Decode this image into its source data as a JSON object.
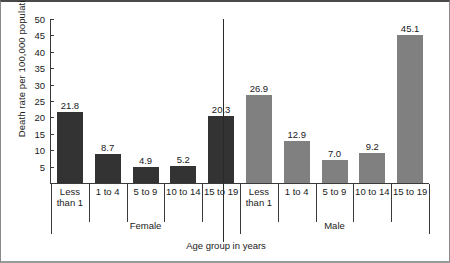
{
  "chart_data": {
    "type": "bar",
    "title": "",
    "xlabel": "Age group in years",
    "ylabel": "Death rate per 100,000 population",
    "ylim": [
      0,
      50
    ],
    "ytick_values": [
      0,
      5,
      10,
      15,
      20,
      25,
      30,
      35,
      40,
      45,
      50
    ],
    "ytick_labels": [
      "",
      "5",
      "10",
      "15",
      "20",
      "25",
      "30",
      "35",
      "40",
      "45",
      "50"
    ],
    "grid": false,
    "legend": "none",
    "categories": [
      "Less than 1",
      "1 to 4",
      "5 to 9",
      "10 to 14",
      "15 to 19"
    ],
    "groups": [
      {
        "name": "Female",
        "color": "#333333",
        "bars": [
          {
            "category": "Less\nthan 1",
            "label_line1": "Less",
            "label_line2": "than 1",
            "value": 21.8,
            "value_label": "21.8"
          },
          {
            "category": "1 to 4",
            "label_line1": "1 to 4",
            "label_line2": "",
            "value": 8.7,
            "value_label": "8.7"
          },
          {
            "category": "5 to 9",
            "label_line1": "5 to 9",
            "label_line2": "",
            "value": 4.9,
            "value_label": "4.9"
          },
          {
            "category": "10 to 14",
            "label_line1": "10 to 14",
            "label_line2": "",
            "value": 5.2,
            "value_label": "5.2"
          },
          {
            "category": "15 to 19",
            "label_line1": "15 to 19",
            "label_line2": "",
            "value": 20.3,
            "value_label": "20.3"
          }
        ]
      },
      {
        "name": "Male",
        "color": "#808080",
        "bars": [
          {
            "category": "Less\nthan 1",
            "label_line1": "Less",
            "label_line2": "than 1",
            "value": 26.9,
            "value_label": "26.9"
          },
          {
            "category": "1 to 4",
            "label_line1": "1 to 4",
            "label_line2": "",
            "value": 12.9,
            "value_label": "12.9"
          },
          {
            "category": "5 to 9",
            "label_line1": "5 to 9",
            "label_line2": "",
            "value": 7.0,
            "value_label": "7.0"
          },
          {
            "category": "10 to 14",
            "label_line1": "10 to 14",
            "label_line2": "",
            "value": 9.2,
            "value_label": "9.2"
          },
          {
            "category": "15 to 19",
            "label_line1": "15 to 19",
            "label_line2": "",
            "value": 45.1,
            "value_label": "45.1"
          }
        ]
      }
    ],
    "series": [
      {
        "name": "Female",
        "values": [
          21.8,
          8.7,
          4.9,
          5.2,
          20.3
        ]
      },
      {
        "name": "Male",
        "values": [
          26.9,
          12.9,
          7.0,
          9.2,
          45.1
        ]
      }
    ]
  },
  "colors": {
    "female_bar": "#333333",
    "male_bar": "#808080",
    "axis": "#3a3a3a",
    "text": "#1a1a1a",
    "background": "#ffffff"
  }
}
